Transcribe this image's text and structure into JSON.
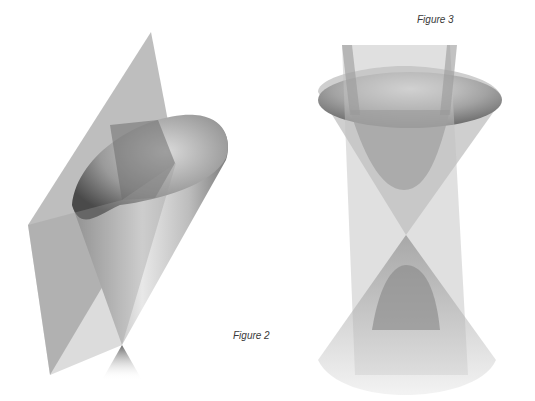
{
  "figures": [
    {
      "id": "figure-2",
      "caption": "Figure 2",
      "depicts": "plane intersecting a double cone (parabola section)"
    },
    {
      "id": "figure-3",
      "caption": "Figure 3",
      "depicts": "vertical plane intersecting a double cone (hyperbola section)"
    }
  ],
  "colors": {
    "background": "#ffffff",
    "plane": "#9a9a9a",
    "cone_dark": "#5a5a5a",
    "cone_light": "#e6e6e6",
    "caption": "#3a3a3a"
  }
}
